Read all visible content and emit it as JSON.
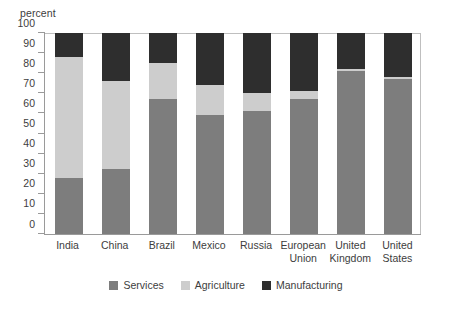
{
  "chart_data": {
    "type": "bar",
    "subtype": "stacked-bar-100-percent",
    "title": "",
    "unit_caption": "percent",
    "xlabel": "",
    "ylabel": "percent",
    "ylim": [
      0,
      100
    ],
    "ytick_step": 10,
    "yticks": [
      0,
      10,
      20,
      30,
      40,
      50,
      60,
      70,
      80,
      90,
      100
    ],
    "ytick_labels": [
      "0",
      "10",
      "20",
      "30",
      "40",
      "50",
      "60",
      "70",
      "80",
      "90",
      "100"
    ],
    "grid": false,
    "legend_position": "bottom-center",
    "categories": [
      "India",
      "China",
      "Brazil",
      "Mexico",
      "Russia",
      "European\nUnion",
      "United\nKingdom",
      "United\nStates"
    ],
    "stack_order_bottom_to_top": [
      "Services",
      "Agriculture",
      "Manufacturing"
    ],
    "series": [
      {
        "name": "Services",
        "color": "#7d7d7d",
        "values": [
          28,
          32.5,
          67,
          59,
          61,
          67,
          81,
          77
        ]
      },
      {
        "name": "Agriculture",
        "color": "#cdcdcd",
        "values": [
          60,
          43.5,
          18,
          15,
          9,
          4,
          1,
          1
        ]
      },
      {
        "name": "Manufacturing",
        "color": "#2e2e2e",
        "values": [
          12,
          24,
          15,
          26,
          30,
          29,
          18,
          22
        ]
      }
    ],
    "cumulative_tops": {
      "services": [
        28,
        32.5,
        67,
        59,
        61,
        67,
        81,
        77
      ],
      "agriculture": [
        88,
        76,
        85,
        74,
        70,
        71,
        82,
        78
      ],
      "manufacturing": [
        100,
        100,
        100,
        100,
        100,
        100,
        100,
        100
      ]
    }
  },
  "legend": {
    "items": [
      {
        "label": "Services",
        "color": "#7d7d7d"
      },
      {
        "label": "Agriculture",
        "color": "#cdcdcd"
      },
      {
        "label": "Manufacturing",
        "color": "#2e2e2e"
      }
    ]
  },
  "colors": {
    "services": "#7d7d7d",
    "agriculture": "#cdcdcd",
    "manufacturing": "#2e2e2e",
    "axis": "#9a9a9a",
    "text": "#3d3d3d",
    "background": "#ffffff"
  }
}
